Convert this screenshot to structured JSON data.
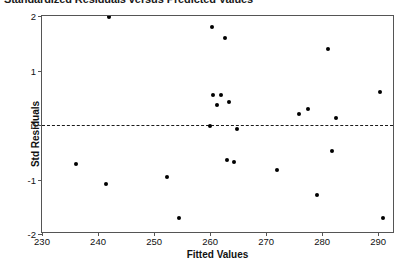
{
  "chart_data": {
    "type": "scatter",
    "title": "Standardized Residuals versus Predicted Values",
    "xlabel": "Fitted Values",
    "ylabel": "Std Residuals",
    "xlim": [
      230,
      293
    ],
    "ylim": [
      -2,
      2
    ],
    "xticks": [
      230,
      240,
      250,
      260,
      270,
      280,
      290
    ],
    "xtick_labels": [
      "230",
      "240",
      "250",
      "260",
      "270",
      "280",
      "290"
    ],
    "yticks": [
      2,
      1,
      0,
      -1,
      -2
    ],
    "ytick_labels": [
      "2",
      "1",
      "0",
      "-1",
      "-2"
    ],
    "grid": false,
    "legend": null,
    "reference_line": {
      "orientation": "horizontal",
      "y": 0,
      "style": "dashed"
    },
    "marker": {
      "shape": "circle",
      "color": "#000000",
      "size": 4
    },
    "points": [
      {
        "x": 236.0,
        "y": -0.72
      },
      {
        "x": 241.5,
        "y": -1.08
      },
      {
        "x": 242.0,
        "y": 1.98
      },
      {
        "x": 252.3,
        "y": -0.95
      },
      {
        "x": 254.5,
        "y": -1.7
      },
      {
        "x": 260.0,
        "y": -0.02
      },
      {
        "x": 260.3,
        "y": 1.8
      },
      {
        "x": 260.6,
        "y": 0.55
      },
      {
        "x": 262.0,
        "y": 0.55
      },
      {
        "x": 261.3,
        "y": 0.37
      },
      {
        "x": 262.6,
        "y": 1.6
      },
      {
        "x": 263.4,
        "y": 0.42
      },
      {
        "x": 263.0,
        "y": -0.65
      },
      {
        "x": 264.2,
        "y": -0.67
      },
      {
        "x": 264.8,
        "y": -0.08
      },
      {
        "x": 272.0,
        "y": -0.82
      },
      {
        "x": 275.8,
        "y": 0.2
      },
      {
        "x": 277.4,
        "y": 0.3
      },
      {
        "x": 279.0,
        "y": -1.28
      },
      {
        "x": 281.0,
        "y": 1.4
      },
      {
        "x": 281.7,
        "y": -0.47
      },
      {
        "x": 282.5,
        "y": 0.12
      },
      {
        "x": 290.3,
        "y": 0.6
      },
      {
        "x": 290.8,
        "y": -1.7
      }
    ]
  }
}
